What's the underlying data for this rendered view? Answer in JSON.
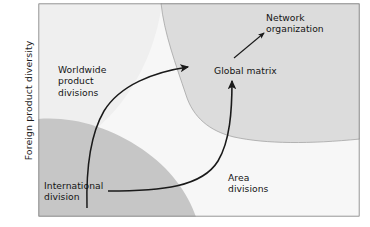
{
  "figure": {
    "title_implied": "International structural stages model",
    "axis": {
      "y_label": "Foreign product diversity"
    },
    "colors": {
      "region_light": "#f2f2f2",
      "region_mid_gray": "#dedede",
      "region_dark_gray": "#c6c6c6",
      "region_center_white": "#f6f6f6",
      "frame_border": "#6f6f6f",
      "arrow": "#1a1a1a",
      "region_divider": "#9a9a9a",
      "text": "#141414"
    },
    "regions": [
      {
        "name": "worldwide-product-divisions-region",
        "shade": "#f0f0f0"
      },
      {
        "name": "network-organization-region",
        "shade": "#dcdcdc"
      },
      {
        "name": "international-division-region",
        "shade": "#c4c4c4"
      },
      {
        "name": "area-divisions-region",
        "shade": "#f6f6f6"
      }
    ],
    "labels": {
      "worldwide_product_divisions": "Worldwide\nproduct\ndivisions",
      "international_division": "International\ndivision",
      "global_matrix": "Global matrix",
      "network_organization": "Network\norganization",
      "area_divisions": "Area\ndivisions"
    },
    "arrows": [
      {
        "name": "worldwide-to-global-matrix-arrow",
        "from": "Worldwide product divisions",
        "to": "Global matrix"
      },
      {
        "name": "international-to-global-matrix-arrow",
        "from": "International division",
        "to": "Global matrix"
      },
      {
        "name": "global-matrix-to-network-arrow",
        "from": "Global matrix",
        "to": "Network organization"
      }
    ]
  }
}
